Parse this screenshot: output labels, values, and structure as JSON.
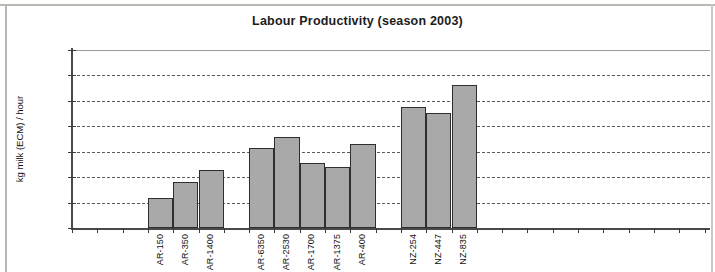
{
  "chart_data": {
    "type": "bar",
    "title": "Labour Productivity (season 2003)",
    "xlabel": "",
    "ylabel": "kg milk (ECM) / hour",
    "ylim": [
      0,
      350
    ],
    "ytick_step": 50,
    "yticks": [
      "0",
      "50",
      "100",
      "150",
      "200",
      "250",
      "300",
      "350"
    ],
    "grid": true,
    "legend": "none",
    "bar_color": "#a9a9a9",
    "bar_edge_color": "#2e2e2e",
    "categories": [
      "AR-150",
      "AR-350",
      "AR-1400",
      "AR-6350",
      "AR-2530",
      "AR-1700",
      "AR-1375",
      "AR-400",
      "NZ-254",
      "NZ-447",
      "NZ-835"
    ],
    "values": [
      60,
      90,
      115,
      158,
      178,
      128,
      120,
      165,
      238,
      226,
      282
    ],
    "groups": [
      {
        "name": "AR group 1",
        "categories": [
          "AR-150",
          "AR-350",
          "AR-1400"
        ],
        "values": [
          60,
          90,
          115
        ]
      },
      {
        "name": "AR group 2",
        "categories": [
          "AR-6350",
          "AR-2530",
          "AR-1700",
          "AR-1375",
          "AR-400"
        ],
        "values": [
          158,
          178,
          128,
          120,
          165
        ]
      },
      {
        "name": "NZ group",
        "categories": [
          "NZ-254",
          "NZ-447",
          "NZ-835"
        ],
        "values": [
          238,
          226,
          282
        ]
      }
    ]
  }
}
